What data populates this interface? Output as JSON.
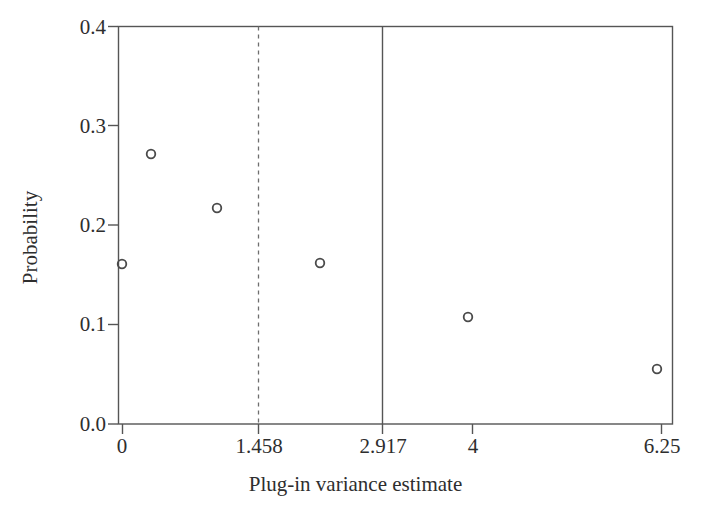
{
  "figure": {
    "background_color": "#ffffff",
    "axis_color": "#555555",
    "marker_color": "#4a4a4a",
    "text_color": "#2e2e2e"
  },
  "chart_data": {
    "type": "scatter",
    "title": "",
    "subtitle": "",
    "xlabel": "Plug-in variance estimate",
    "ylabel": "Probability",
    "grid": false,
    "legend": null,
    "legend_position": "none",
    "xtick_labels": [
      "0",
      "1.458",
      "2.917",
      "4",
      "6.25"
    ],
    "xtick_values": [
      0,
      1.458,
      2.917,
      4,
      6.25
    ],
    "ytick_labels": [
      "0.0",
      "0.1",
      "0.2",
      "0.3",
      "0.4"
    ],
    "ytick_values": [
      0.0,
      0.1,
      0.2,
      0.3,
      0.4
    ],
    "ylim": [
      0.0,
      0.4
    ],
    "xlim": [
      0,
      6.25
    ],
    "marker": "open-circle",
    "x": [
      0,
      0.21,
      0.7,
      1.48,
      2.53,
      4.0
    ],
    "y": [
      0.164,
      0.278,
      0.222,
      0.165,
      0.112,
      0.057
    ],
    "points": [
      {
        "x": 0,
        "y": 0.164,
        "px": 122,
        "py": 264
      },
      {
        "x": 0.21,
        "y": 0.278,
        "px": 151,
        "py": 154
      },
      {
        "x": 0.7,
        "y": 0.222,
        "px": 217,
        "py": 208
      },
      {
        "x": 1.48,
        "y": 0.165,
        "px": 320,
        "py": 263
      },
      {
        "x": 2.53,
        "y": 0.112,
        "px": 468,
        "py": 317
      },
      {
        "x": 4.0,
        "y": 0.057,
        "px": 657,
        "py": 369
      }
    ],
    "annotations": [
      {
        "name": "dashed-reference-line",
        "kind": "vline",
        "x": 1.458,
        "style": "dashed",
        "px": 258
      },
      {
        "name": "solid-reference-line",
        "kind": "vline",
        "x": 2.917,
        "style": "solid",
        "px": 382
      }
    ]
  }
}
